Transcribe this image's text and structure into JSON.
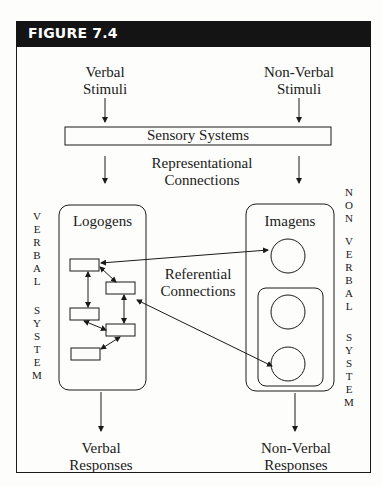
{
  "figure": {
    "label": "FIGURE 7.4"
  },
  "inputs": {
    "verbal_stimuli": [
      "Verbal",
      "Stimuli"
    ],
    "nonverbal_stimuli": [
      "Non-Verbal",
      "Stimuli"
    ]
  },
  "sensory": {
    "label": "Sensory Systems"
  },
  "representational": [
    "Representational",
    "Connections"
  ],
  "referential": [
    "Referential",
    "Connections"
  ],
  "verbal_system": {
    "box_label": "Logogens",
    "side_label_top": "VERBAL",
    "side_label_bottom": "SYSTEM",
    "node_count": 5
  },
  "nonverbal_system": {
    "box_label": "Imagens",
    "side_label_top": [
      "N",
      "O",
      "N"
    ],
    "side_label_mid": "VERBAL",
    "side_label_bottom": "SYSTEM",
    "node_count": 3
  },
  "outputs": {
    "verbal_responses": [
      "Verbal",
      "Responses"
    ],
    "nonverbal_responses": [
      "Non-Verbal",
      "Responses"
    ]
  },
  "colors": {
    "header_bg": "#141414",
    "header_text": "#ffffff",
    "line": "#1a1a1a",
    "background": "#fdfdfb"
  }
}
